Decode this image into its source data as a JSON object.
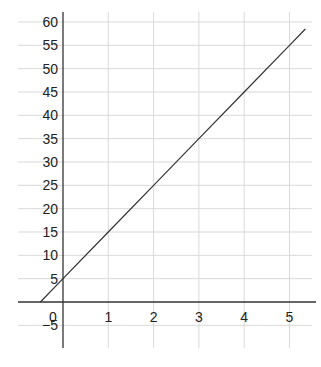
{
  "chart_data": {
    "type": "line",
    "title": "",
    "xlabel": "",
    "ylabel": "",
    "xlim": [
      -1,
      5.5
    ],
    "ylim": [
      -10,
      62
    ],
    "grid": true,
    "x_ticks": [
      0,
      1,
      2,
      3,
      4,
      5
    ],
    "x_tick_labels": [
      "0",
      "1",
      "2",
      "3",
      "4",
      "5"
    ],
    "y_ticks": [
      -5,
      5,
      10,
      15,
      20,
      25,
      30,
      35,
      40,
      45,
      50,
      55,
      60
    ],
    "y_tick_labels": [
      "−5",
      "5",
      "10",
      "15",
      "20",
      "25",
      "30",
      "35",
      "40",
      "45",
      "50",
      "55",
      "60"
    ],
    "series": [
      {
        "name": "y = 10x + 5",
        "x": [
          -0.5,
          0,
          1,
          2,
          3,
          4,
          5,
          5.35
        ],
        "y": [
          0,
          5,
          15,
          25,
          35,
          45,
          55,
          58.5
        ]
      }
    ]
  },
  "colors": {
    "grid": "#d9d9d9",
    "axis": "#333333",
    "line": "#333333"
  }
}
